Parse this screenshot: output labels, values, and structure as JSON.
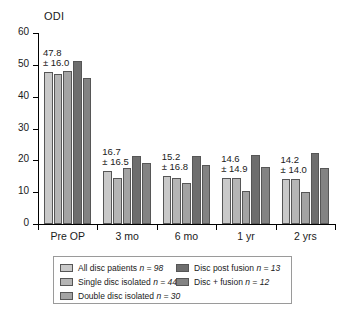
{
  "chart_data": {
    "type": "bar",
    "title": "",
    "subtitle": "",
    "xlabel": "",
    "ylabel": "ODI",
    "ylim": [
      0,
      60
    ],
    "ytick_step": 10,
    "yticks": [
      60,
      50,
      40,
      30,
      20,
      10,
      0
    ],
    "grid": false,
    "legend_position": "bottom",
    "categories": [
      "Pre OP",
      "3 mo",
      "6 mo",
      "1 yr",
      "2 yrs"
    ],
    "series": [
      {
        "name": "All disc patients",
        "n": 98,
        "legend_label": "All disc patients n = 98",
        "color": "#c9c9c9",
        "values": [
          47.8,
          16.7,
          15.2,
          14.6,
          14.2
        ]
      },
      {
        "name": "Single disc isolated",
        "n": 44,
        "legend_label": "Single disc isolated n = 44",
        "color": "#b5b5b5",
        "values": [
          47.2,
          14.6,
          14.6,
          14.6,
          14.1
        ]
      },
      {
        "name": "Double disc isolated",
        "n": 30,
        "legend_label": "Double disc isolated n = 30",
        "color": "#a3a3a3",
        "values": [
          48.0,
          17.6,
          13.0,
          10.4,
          10.2
        ]
      },
      {
        "name": "Disc post fusion",
        "n": 13,
        "legend_label": "Disc post fusion n = 13",
        "color": "#6e6e6e",
        "values": [
          51.2,
          21.3,
          21.3,
          21.7,
          22.4
        ]
      },
      {
        "name": "Disc + fusion",
        "n": 12,
        "legend_label": "Disc + fusion n = 12",
        "color": "#838383",
        "values": [
          46.0,
          19.2,
          18.4,
          17.9,
          17.6
        ]
      }
    ],
    "annotations": [
      {
        "category": "Pre OP",
        "mean": "47.8",
        "sd": "± 16.0"
      },
      {
        "category": "3 mo",
        "mean": "16.7",
        "sd": "± 16.5"
      },
      {
        "category": "6 mo",
        "mean": "15.2",
        "sd": "± 16.8"
      },
      {
        "category": "1 yr",
        "mean": "14.6",
        "sd": "± 14.9"
      },
      {
        "category": "2 yrs",
        "mean": "14.2",
        "sd": "± 14.0"
      }
    ]
  },
  "axis": {
    "y_title": "ODI",
    "tick_labels": [
      "60",
      "50",
      "40",
      "30",
      "20",
      "10",
      "0"
    ]
  },
  "x_axis": {
    "labels": [
      "Pre OP",
      "3 mo",
      "6 mo",
      "1 yr",
      "2 yrs"
    ]
  },
  "legend": {
    "left_items": [
      {
        "label_main": "All disc patients",
        "n_text": "n = 98",
        "color": "#c9c9c9"
      },
      {
        "label_main": "Single disc isolated",
        "n_text": "n = 44",
        "color": "#b5b5b5"
      },
      {
        "label_main": "Double disc isolated",
        "n_text": "n = 30",
        "color": "#a3a3a3"
      }
    ],
    "right_items": [
      {
        "label_main": "Disc post fusion",
        "n_text": "n = 13",
        "color": "#6e6e6e"
      },
      {
        "label_main": "Disc + fusion",
        "n_text": "n = 12",
        "color": "#838383"
      }
    ]
  }
}
